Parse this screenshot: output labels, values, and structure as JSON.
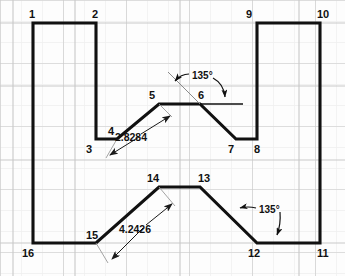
{
  "drawing": {
    "title": "Polyline with 135 degree bends and diagonal dimensions",
    "background_color": "#fdfdfd",
    "grid_minor_color": "#efefef",
    "grid_major_color": "#c8c8c8",
    "outline_color": "#111111",
    "dimension_line_color": "#8a8a8a",
    "grid_minor_spacing": 21,
    "grid_major_spacing": 63
  },
  "vertices": [
    {
      "id": "1",
      "label": "1",
      "x": 33,
      "y": 23,
      "lx": 29,
      "ly": 18
    },
    {
      "id": "2",
      "label": "2",
      "x": 96,
      "y": 23,
      "lx": 92,
      "ly": 18
    },
    {
      "id": "3",
      "label": "3",
      "x": 96,
      "y": 139,
      "lx": 86,
      "ly": 153
    },
    {
      "id": "4",
      "label": "4",
      "x": 117,
      "y": 139,
      "lx": 108,
      "ly": 135
    },
    {
      "id": "5",
      "label": "5",
      "x": 159,
      "y": 104,
      "lx": 149,
      "ly": 99
    },
    {
      "id": "6",
      "label": "6",
      "x": 200,
      "y": 104,
      "lx": 198,
      "ly": 99
    },
    {
      "id": "7",
      "label": "7",
      "x": 236,
      "y": 139,
      "lx": 228,
      "ly": 153
    },
    {
      "id": "8",
      "label": "8",
      "x": 257,
      "y": 139,
      "lx": 254,
      "ly": 153
    },
    {
      "id": "9",
      "label": "9",
      "x": 257,
      "y": 23,
      "lx": 246,
      "ly": 18
    },
    {
      "id": "10",
      "label": "10",
      "x": 320,
      "y": 23,
      "lx": 317,
      "ly": 18
    },
    {
      "id": "11",
      "label": "11",
      "x": 320,
      "y": 243,
      "lx": 317,
      "ly": 257
    },
    {
      "id": "12",
      "label": "12",
      "x": 257,
      "y": 243,
      "lx": 248,
      "ly": 257
    },
    {
      "id": "13",
      "label": "13",
      "x": 200,
      "y": 187,
      "lx": 198,
      "ly": 182
    },
    {
      "id": "14",
      "label": "14",
      "x": 159,
      "y": 187,
      "lx": 147,
      "ly": 182
    },
    {
      "id": "15",
      "label": "15",
      "x": 96,
      "y": 243,
      "lx": 86,
      "ly": 239
    },
    {
      "id": "16",
      "label": "16",
      "x": 33,
      "y": 243,
      "lx": 22,
      "ly": 257
    }
  ],
  "outline_path": "M 33 23 L 96 23 L 96 139 L 117 139 L 159 104 L 200 104 L 236 139 L 257 139 L 257 23 L 320 23 L 320 243 L 257 243 L 200 187 L 159 187 L 96 243 L 33 243 Z",
  "dimensions": [
    {
      "id": "dim-2-8284",
      "value": "2.8284",
      "measured_edge": "4-5",
      "text_x": 131,
      "text_y": 141,
      "line_start": {
        "x": 106,
        "y": 158
      },
      "line_end": {
        "x": 172,
        "y": 117
      },
      "ext_start": {
        "x": 117,
        "y": 139
      },
      "ext_end": {
        "x": 159,
        "y": 104
      }
    },
    {
      "id": "dim-4-2426",
      "value": "4.2426",
      "measured_edge": "15-14",
      "text_x": 135,
      "text_y": 233,
      "line_start": {
        "x": 108,
        "y": 263
      },
      "line_end": {
        "x": 175,
        "y": 206
      },
      "ext_start": {
        "x": 96,
        "y": 243
      },
      "ext_end": {
        "x": 159,
        "y": 187
      }
    }
  ],
  "angles": [
    {
      "id": "angle-upper-135",
      "value": "135°",
      "at_vertex": "6",
      "text_x": 192,
      "text_y": 79,
      "leader_left_tip": {
        "x": 174,
        "y": 82
      },
      "leader_right_tip": {
        "x": 225,
        "y": 99
      }
    },
    {
      "id": "angle-lower-135",
      "value": "135°",
      "at_vertex": "12",
      "text_x": 259,
      "text_y": 213,
      "leader_left_tip": {
        "x": 238,
        "y": 208
      },
      "leader_right_tip": {
        "x": 277,
        "y": 237
      }
    }
  ]
}
